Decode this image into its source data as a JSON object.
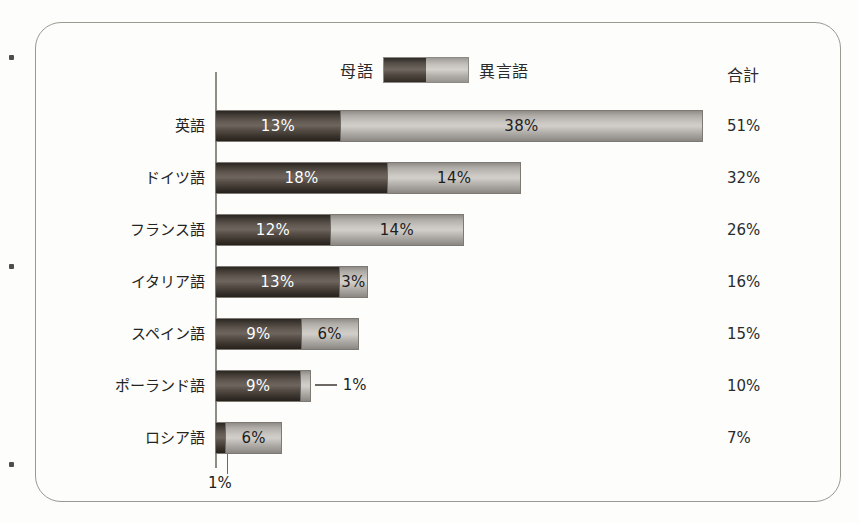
{
  "legend": {
    "native_label": "母語",
    "foreign_label": "異言語",
    "swatch_native_name": "native-speaker-swatch",
    "swatch_foreign_name": "foreign-speaker-swatch"
  },
  "total_column": {
    "header": "合計"
  },
  "colors": {
    "native": "#4a433e",
    "foreign": "#c2bfba",
    "frame": "#9a9a93",
    "axis": "#8f8c86",
    "text": "#242424"
  },
  "chart_data": {
    "type": "bar",
    "orientation": "horizontal",
    "stacked": true,
    "title": "",
    "xlabel": "",
    "ylabel": "",
    "xlim": [
      0,
      51
    ],
    "grid": false,
    "legend_position": "top-center",
    "categories": [
      "英語",
      "ドイツ語",
      "フランス語",
      "イタリア語",
      "スペイン語",
      "ポーランド語",
      "ロシア語"
    ],
    "series": [
      {
        "name": "母語",
        "values": [
          13,
          18,
          12,
          13,
          9,
          9,
          1
        ]
      },
      {
        "name": "異言語",
        "values": [
          38,
          14,
          14,
          3,
          6,
          1,
          6
        ]
      }
    ],
    "totals": [
      51,
      32,
      26,
      16,
      15,
      10,
      7
    ],
    "value_labels": {
      "native": [
        "13%",
        "18%",
        "12%",
        "13%",
        "9%",
        "9%",
        "1%"
      ],
      "foreign": [
        "38%",
        "14%",
        "14%",
        "3%",
        "6%",
        "1%",
        "6%"
      ],
      "totals": [
        "51%",
        "32%",
        "26%",
        "16%",
        "15%",
        "10%",
        "7%"
      ]
    },
    "external_labels": [
      {
        "row": 5,
        "series": "異言語",
        "text": "1%",
        "style": "leader-right"
      },
      {
        "row": 6,
        "series": "母語",
        "text": "1%",
        "style": "leader-below"
      }
    ]
  }
}
